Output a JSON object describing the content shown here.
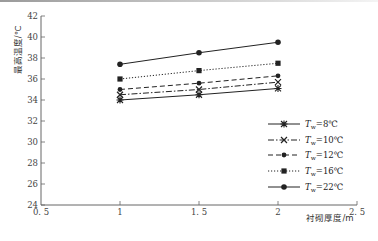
{
  "chart_data": {
    "type": "line",
    "title": "",
    "xlabel": "衬砌厚度/m",
    "ylabel": "最高温度/℃",
    "xlim": [
      0.5,
      2.5
    ],
    "ylim": [
      24,
      42
    ],
    "x_ticks": [
      "0.5",
      "1",
      "1.5",
      "2",
      "2.5"
    ],
    "y_ticks": [
      "24",
      "26",
      "28",
      "30",
      "32",
      "34",
      "36",
      "38",
      "40",
      "42"
    ],
    "x": [
      1,
      1.5,
      2
    ],
    "grid": false,
    "legend_position": "lower right",
    "series": [
      {
        "name": "Tw=8℃",
        "label_main": "T",
        "label_sub": "w",
        "label_rest": "=8℃",
        "marker": "asterisk",
        "dash": "solid",
        "values": [
          34.0,
          34.5,
          35.1
        ]
      },
      {
        "name": "Tw=10℃",
        "label_main": "T",
        "label_sub": "w",
        "label_rest": "=10℃",
        "marker": "x",
        "dash": "dashdot",
        "values": [
          34.5,
          35.0,
          35.7
        ]
      },
      {
        "name": "Tw=12℃",
        "label_main": "T",
        "label_sub": "w",
        "label_rest": "=12℃",
        "marker": "diamond",
        "dash": "dashed",
        "values": [
          35.0,
          35.6,
          36.3
        ]
      },
      {
        "name": "Tw=16℃",
        "label_main": "T",
        "label_sub": "w",
        "label_rest": "=16℃",
        "marker": "square",
        "dash": "dotted",
        "values": [
          36.0,
          36.8,
          37.5
        ]
      },
      {
        "name": "Tw=22℃",
        "label_main": "T",
        "label_sub": "w",
        "label_rest": "=22℃",
        "marker": "circle",
        "dash": "solid",
        "values": [
          37.4,
          38.5,
          39.5
        ]
      }
    ]
  },
  "colors": {
    "line": "#222222",
    "axis": "#666666"
  }
}
